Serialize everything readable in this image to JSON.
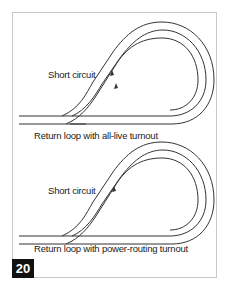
{
  "figure": {
    "number": "20",
    "diagrams": [
      {
        "id": "all-live",
        "short_circuit_label": "Short circuit",
        "caption": "Return loop with all-live turnout",
        "arrows": 2
      },
      {
        "id": "power-routing",
        "short_circuit_label": "Short circuit",
        "caption": "Return loop with power-routing turnout",
        "arrows": 1
      }
    ]
  },
  "colors": {
    "track": "#333333",
    "frame": "#c8c8c8",
    "badge_bg": "#111111",
    "badge_text": "#ffffff"
  }
}
